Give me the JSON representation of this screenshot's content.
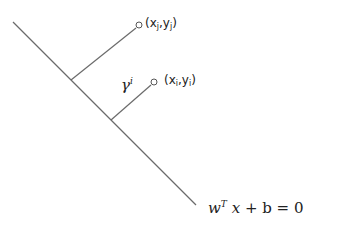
{
  "diagram": {
    "type": "svm-margin-geometry",
    "hyperplane": {
      "label_w": "w",
      "label_T": "T",
      "label_x": "x",
      "label_rest": "+ b = 0"
    },
    "points": [
      {
        "id": "j",
        "label_open": "(x",
        "sub1": "j",
        "mid": ",y",
        "sub2": "j",
        "label_close": ")"
      },
      {
        "id": "i",
        "label_open": "(x",
        "sub1": "i",
        "mid": ",y",
        "sub2": "i",
        "label_close": ")"
      }
    ],
    "margin_label": {
      "symbol": "γ",
      "superscript": "i"
    },
    "colors": {
      "line": "#6b6b6b",
      "text": "#222222",
      "background": "#ffffff"
    }
  }
}
